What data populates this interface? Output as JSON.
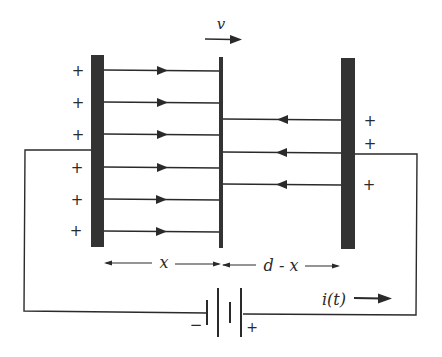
{
  "diagram": {
    "colors": {
      "ink": "#2a2a2a",
      "plate": "#333333",
      "background": "#ffffff"
    },
    "labels": {
      "velocity": "v",
      "left_gap": "x",
      "right_gap": "d - x",
      "current": "i(t)",
      "battery_negative": "−",
      "battery_positive": "+"
    },
    "left_plate": {
      "charge_sign": "+",
      "charges": [
        "+",
        "+",
        "+",
        "+",
        "+",
        "+"
      ],
      "field_lines": 6,
      "field_direction": "right"
    },
    "right_plate": {
      "charge_sign": "+",
      "charges": [
        "+",
        "+",
        "+"
      ],
      "field_lines": 3,
      "field_direction": "left"
    },
    "middle_plate": {
      "motion": "right"
    },
    "circuit": {
      "battery_cells": 2,
      "current_direction": "right"
    }
  }
}
